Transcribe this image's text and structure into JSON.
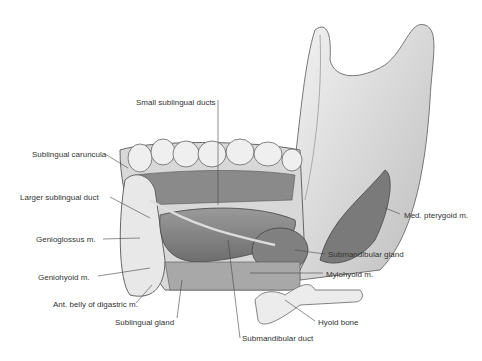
{
  "figure": {
    "labels": [
      {
        "id": "small-sublingual-ducts",
        "text": "Small sublingual ducts",
        "x": 136,
        "y": 98
      },
      {
        "id": "sublingual-caruncula",
        "text": "Sublingual caruncula",
        "x": 32,
        "y": 150
      },
      {
        "id": "larger-sublingual-duct",
        "text": "Larger sublingual duct",
        "x": 20,
        "y": 193
      },
      {
        "id": "genioglossus",
        "text": "Genioglossus m.",
        "x": 36,
        "y": 235
      },
      {
        "id": "geniohyoid",
        "text": "Geniohyoid m.",
        "x": 38,
        "y": 273
      },
      {
        "id": "ant-belly-digastric",
        "text": "Ant. belly of digastric m.",
        "x": 53,
        "y": 300
      },
      {
        "id": "sublingual-gland",
        "text": "Sublingual gland",
        "x": 115,
        "y": 318
      },
      {
        "id": "submandibular-duct",
        "text": "Submandibular duct",
        "x": 242,
        "y": 334
      },
      {
        "id": "hyoid-bone",
        "text": "Hyoid bone",
        "x": 318,
        "y": 318
      },
      {
        "id": "mylohyoid",
        "text": "Mylohyoid m.",
        "x": 326,
        "y": 270
      },
      {
        "id": "submandibular-gland",
        "text": "Submandibular gland",
        "x": 328,
        "y": 250
      },
      {
        "id": "med-pterygoid",
        "text": "Med. pterygoid m.",
        "x": 404,
        "y": 211
      }
    ]
  }
}
